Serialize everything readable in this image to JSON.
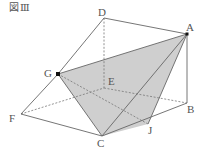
{
  "figure": {
    "caption": "図Ⅲ",
    "shade_color": "#cfcfcf",
    "line_color": "#666666",
    "labels": {
      "A": "A",
      "B": "B",
      "C": "C",
      "D": "D",
      "E": "E",
      "F": "F",
      "G": "G",
      "J": "J"
    },
    "points": {
      "A": [
        187,
        34
      ],
      "B": [
        187,
        103
      ],
      "C": [
        102,
        136
      ],
      "D": [
        104,
        18
      ],
      "E": [
        104,
        88
      ],
      "F": [
        21,
        114
      ],
      "G": [
        58,
        74
      ],
      "J": [
        148,
        124
      ]
    }
  }
}
